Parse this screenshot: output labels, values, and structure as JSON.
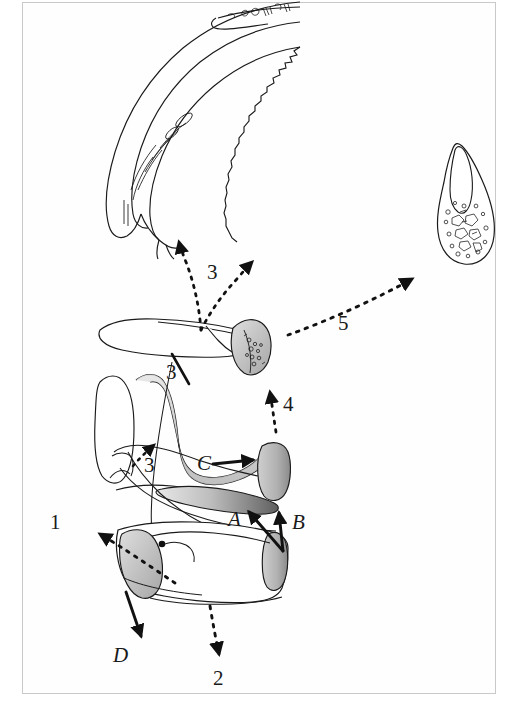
{
  "figure": {
    "type": "anatomical-line-drawing",
    "frame_color": "#c9c9c9",
    "ink_color": "#1a1a1a",
    "background_color": "#ffffff",
    "shade_light": "#d9d9d9",
    "shade_mid": "#a8a8a8",
    "shade_dark": "#6e6e6e"
  },
  "annotations": {
    "numeric": [
      {
        "id": "label-1",
        "text": "1",
        "x": 50,
        "y": 512,
        "arrow": "dotted",
        "direction": "up-left"
      },
      {
        "id": "label-2",
        "text": "2",
        "x": 213,
        "y": 668,
        "arrow": "dotted",
        "direction": "down"
      },
      {
        "id": "label-3a",
        "text": "3",
        "x": 207,
        "y": 262,
        "arrow": "dotted",
        "direction": "branching-up"
      },
      {
        "id": "label-3b",
        "text": "3",
        "x": 166,
        "y": 362,
        "arrow": "solid-pointer",
        "direction": "up"
      },
      {
        "id": "label-3c",
        "text": "3",
        "x": 144,
        "y": 455,
        "arrow": "dotted",
        "direction": "up-right"
      },
      {
        "id": "label-4",
        "text": "4",
        "x": 283,
        "y": 394,
        "arrow": "dotted",
        "direction": "up"
      },
      {
        "id": "label-5",
        "text": "5",
        "x": 338,
        "y": 313,
        "arrow": "dotted",
        "direction": "up-right"
      }
    ],
    "lettered": [
      {
        "id": "label-A",
        "text": "A",
        "x": 228,
        "y": 509,
        "arrow": "solid",
        "direction": "up-left"
      },
      {
        "id": "label-B",
        "text": "B",
        "x": 292,
        "y": 512,
        "arrow": "solid",
        "direction": "up"
      },
      {
        "id": "label-C",
        "text": "C",
        "x": 197,
        "y": 453,
        "arrow": "solid",
        "direction": "right"
      },
      {
        "id": "label-D",
        "text": "D",
        "x": 113,
        "y": 645,
        "arrow": "solid",
        "direction": "down"
      }
    ]
  },
  "structures": [
    {
      "id": "curved-jaw-arc",
      "name": "curved serrated jaw arc",
      "region": "top"
    },
    {
      "id": "upper-process",
      "name": "upper elongate process",
      "region": "upper-middle"
    },
    {
      "id": "condyle-textured",
      "name": "textured condyle head",
      "region": "upper-middle-right"
    },
    {
      "id": "inset-bone-detail",
      "name": "inset bone cross-section detail",
      "region": "right"
    },
    {
      "id": "central-body",
      "name": "central vertebral body complex",
      "region": "middle"
    },
    {
      "id": "lower-body",
      "name": "lower centrum block",
      "region": "lower-middle"
    }
  ]
}
